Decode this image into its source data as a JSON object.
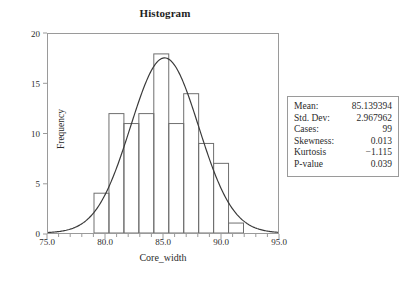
{
  "chart_data": {
    "type": "bar",
    "title": "Histogram",
    "xlabel": "Core_width",
    "ylabel": "Frequency",
    "xlim": [
      75.0,
      95.0
    ],
    "ylim": [
      0,
      20
    ],
    "grid": false,
    "legend": null,
    "x_major_ticks": [
      75.0,
      80.0,
      85.0,
      90.0,
      95.0
    ],
    "x_tick_labels": [
      "75.0",
      "80.0",
      "85.0",
      "90.0",
      "95.0"
    ],
    "x_minor_tick_step": 1.0,
    "y_ticks": [
      0,
      5,
      10,
      15,
      20
    ],
    "y_tick_labels": [
      "0",
      "5",
      "10",
      "15",
      "20"
    ],
    "bin_edges": [
      79.0,
      80.3,
      81.6,
      82.9,
      84.2,
      85.5,
      86.8,
      88.1,
      89.4,
      90.7,
      92.0
    ],
    "categories": [
      "79.0-80.3",
      "80.3-81.6",
      "81.6-82.9",
      "82.9-84.2",
      "84.2-85.5",
      "85.5-86.8",
      "86.8-88.1",
      "88.1-89.4",
      "89.4-90.7",
      "90.7-92.0"
    ],
    "values": [
      4,
      12,
      11,
      12,
      18,
      11,
      14,
      9,
      7,
      1
    ],
    "overlay": {
      "name": "normal-curve",
      "type": "line",
      "mean": 85.139394,
      "std_dev": 2.967962,
      "peak_value": 17.6
    }
  },
  "stats": {
    "rows": [
      {
        "label": "Mean:",
        "value": "85.139394"
      },
      {
        "label": "Std. Dev:",
        "value": "2.967962"
      },
      {
        "label": "Cases:",
        "value": "99"
      },
      {
        "label": "Skewness:",
        "value": "0.013"
      },
      {
        "label": "Kurtosis",
        "value": "−1.115"
      },
      {
        "label": "P-value",
        "value": "0.039"
      }
    ]
  },
  "colors": {
    "axis": "#9a9a9a",
    "bar_edge": "#6e6e6e",
    "curve": "#3a3a3a",
    "text": "#2b2b2b",
    "background": "#ffffff"
  }
}
